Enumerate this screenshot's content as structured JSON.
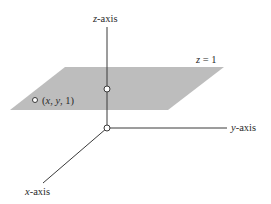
{
  "diagram": {
    "colors": {
      "plane": "#bdbdbd",
      "axis": "#3a3a3a",
      "text": "#2a2a2a",
      "point_fill": "#ffffff"
    },
    "axes": {
      "z": {
        "var": "z",
        "suffix": "-axis"
      },
      "y": {
        "var": "y",
        "suffix": "-axis"
      },
      "x": {
        "var": "x",
        "suffix": "-axis"
      }
    },
    "plane_label": {
      "var": "z",
      "rest": " = 1"
    },
    "point_label": {
      "open": "(",
      "x": "x",
      "sep1": ", ",
      "y": "y",
      "sep2": ", ",
      "z": "1",
      "close": ")"
    }
  }
}
